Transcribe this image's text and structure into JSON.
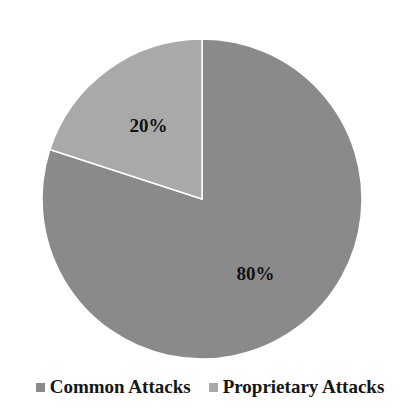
{
  "chart_data": {
    "type": "pie",
    "title": "",
    "categories": [
      "Common Attacks",
      "Proprietary Attacks"
    ],
    "values": [
      80,
      20
    ],
    "labels": [
      "80%",
      "20%"
    ],
    "colors": [
      "#8a8a8a",
      "#a9a9a9"
    ],
    "start_angle_deg": 0,
    "direction": "clockwise",
    "legend_position": "bottom"
  },
  "legend": {
    "items": [
      {
        "label": "Common Attacks",
        "color": "#8a8a8a"
      },
      {
        "label": "Proprietary Attacks",
        "color": "#a9a9a9"
      }
    ]
  }
}
